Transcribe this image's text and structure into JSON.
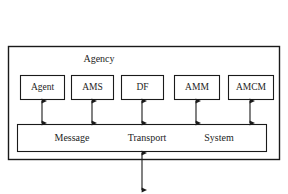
{
  "diagram": {
    "type": "block-diagram",
    "title": "Agency",
    "container": {
      "label": "Agency",
      "label_x": 99,
      "label_y": 60
    },
    "components": [
      {
        "id": "agent",
        "label": "Agent",
        "x": 20,
        "y": 75,
        "w": 44,
        "h": 24
      },
      {
        "id": "ams",
        "label": "AMS",
        "x": 71,
        "y": 75,
        "w": 42,
        "h": 24
      },
      {
        "id": "df",
        "label": "DF",
        "x": 121,
        "y": 75,
        "w": 42,
        "h": 24
      },
      {
        "id": "amm",
        "label": "AMM",
        "x": 174,
        "y": 75,
        "w": 45,
        "h": 24
      },
      {
        "id": "amcm",
        "label": "AMCM",
        "x": 228,
        "y": 75,
        "w": 45,
        "h": 24
      }
    ],
    "bus": {
      "id": "message-transport-system",
      "x": 17,
      "y": 124,
      "w": 249,
      "h": 27,
      "words": [
        {
          "text": "Message",
          "x": 72
        },
        {
          "text": "Transport",
          "x": 147
        },
        {
          "text": "System",
          "x": 219
        }
      ]
    },
    "connectors": [
      {
        "from": "agent",
        "to": "bus",
        "x": 42,
        "double_headed": true
      },
      {
        "from": "ams",
        "to": "bus",
        "x": 92,
        "double_headed": true
      },
      {
        "from": "df",
        "to": "bus",
        "x": 142,
        "double_headed": true
      },
      {
        "from": "amm",
        "to": "bus",
        "x": 196,
        "double_headed": true
      },
      {
        "from": "amcm",
        "to": "bus",
        "x": 250,
        "double_headed": true
      },
      {
        "from": "bus",
        "to": "external",
        "x": 142,
        "double_headed": true
      }
    ],
    "colors": {
      "stroke": "#1a1a1a",
      "background": "#ffffff",
      "text": "#1d1d1d"
    }
  }
}
